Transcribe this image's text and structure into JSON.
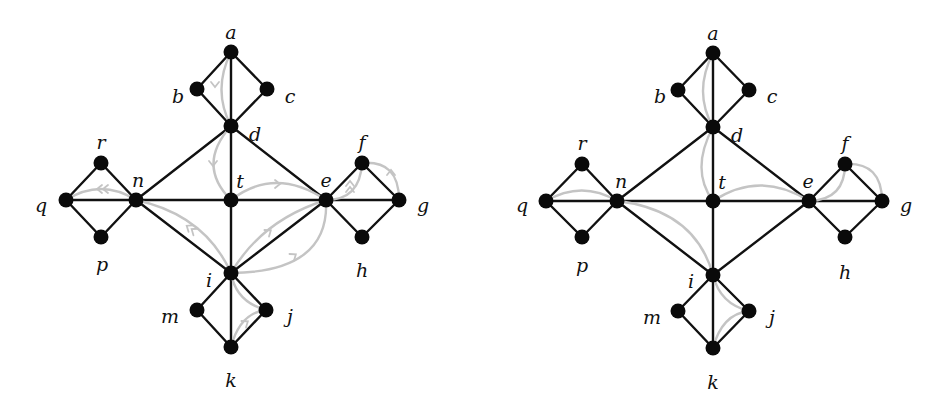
{
  "figure": {
    "panels": [
      {
        "id": "left",
        "offset_x": 0,
        "directed": true,
        "nodes": {
          "a": [
            231,
            52
          ],
          "b": [
            197,
            89
          ],
          "c": [
            267,
            89
          ],
          "d": [
            231,
            126
          ],
          "r": [
            101,
            163
          ],
          "n": [
            136,
            200
          ],
          "q": [
            66,
            200
          ],
          "p": [
            101,
            237
          ],
          "t": [
            231,
            200
          ],
          "e": [
            326,
            200
          ],
          "f": [
            362,
            163
          ],
          "g": [
            399,
            200
          ],
          "h": [
            362,
            237
          ],
          "i": [
            231,
            273
          ],
          "m": [
            197,
            310
          ],
          "j": [
            266,
            310
          ],
          "k": [
            231,
            347
          ]
        },
        "labels": {
          "a": [
            231,
            34
          ],
          "b": [
            178,
            98
          ],
          "c": [
            290,
            98
          ],
          "d": [
            255,
            136
          ],
          "r": [
            101,
            144
          ],
          "n": [
            138,
            182
          ],
          "q": [
            41,
            207
          ],
          "p": [
            102,
            266
          ],
          "t": [
            240,
            183
          ],
          "e": [
            326,
            182
          ],
          "f": [
            362,
            144
          ],
          "g": [
            423,
            207
          ],
          "h": [
            362,
            272
          ],
          "i": [
            209,
            282
          ],
          "m": [
            170,
            318
          ],
          "j": [
            290,
            318
          ],
          "k": [
            231,
            382
          ]
        },
        "edges": [
          [
            "a",
            "b"
          ],
          [
            "a",
            "c"
          ],
          [
            "b",
            "d"
          ],
          [
            "c",
            "d"
          ],
          [
            "a",
            "d"
          ],
          [
            "d",
            "t"
          ],
          [
            "d",
            "n"
          ],
          [
            "d",
            "e"
          ],
          [
            "n",
            "t"
          ],
          [
            "t",
            "e"
          ],
          [
            "n",
            "i"
          ],
          [
            "e",
            "i"
          ],
          [
            "t",
            "i"
          ],
          [
            "q",
            "r"
          ],
          [
            "q",
            "p"
          ],
          [
            "r",
            "n"
          ],
          [
            "p",
            "n"
          ],
          [
            "q",
            "n"
          ],
          [
            "e",
            "f"
          ],
          [
            "e",
            "h"
          ],
          [
            "f",
            "g"
          ],
          [
            "h",
            "g"
          ],
          [
            "e",
            "g"
          ],
          [
            "i",
            "m"
          ],
          [
            "i",
            "j"
          ],
          [
            "m",
            "k"
          ],
          [
            "j",
            "k"
          ],
          [
            "i",
            "k"
          ]
        ],
        "curves": [
          {
            "d": "M231,52 Q212,90 231,126",
            "arrow": [
              215,
              86
            ],
            "dir": "down"
          },
          {
            "d": "M231,126 Q196,165 231,200",
            "arrow": [
              213,
              165
            ],
            "dir": "down"
          },
          {
            "d": "M66,200 Q101,178 136,200",
            "arrow": [
              101,
              189
            ],
            "dir": "left",
            "double": true
          },
          {
            "d": "M136,200 Q205,215 231,273",
            "arrow": [
              190,
              228
            ],
            "dir": "up-left",
            "double": true
          },
          {
            "d": "M231,200 Q275,166 326,200",
            "arrow": [
              279,
              184
            ],
            "dir": "right"
          },
          {
            "d": "M326,200 Q262,220 231,273",
            "arrow": [
              270,
              231
            ],
            "dir": "up-right"
          },
          {
            "d": "M326,200 Q330,272 231,273",
            "arrow": [
              295,
              255
            ],
            "dir": "up-right"
          },
          {
            "d": "M326,200 Q360,200 362,163",
            "arrow": [
              350,
              185
            ],
            "dir": "up",
            "double": true
          },
          {
            "d": "M362,163 Q399,160 399,200",
            "arrow": [
              391,
              171
            ],
            "dir": "up"
          },
          {
            "d": "M231,273 Q236,302 266,310",
            "arrow": [
              245,
              296
            ],
            "dir": "none"
          },
          {
            "d": "M266,310 Q240,313 231,347",
            "arrow": [
              247,
              322
            ],
            "dir": "up-right"
          }
        ]
      },
      {
        "id": "right",
        "offset_x": 0,
        "directed": false,
        "nodes": {
          "a": [
            713,
            53
          ],
          "b": [
            678,
            90
          ],
          "c": [
            749,
            90
          ],
          "d": [
            713,
            127
          ],
          "r": [
            582,
            164
          ],
          "n": [
            617,
            201
          ],
          "q": [
            546,
            201
          ],
          "p": [
            582,
            237
          ],
          "t": [
            713,
            201
          ],
          "e": [
            809,
            201
          ],
          "f": [
            845,
            164
          ],
          "g": [
            882,
            201
          ],
          "h": [
            845,
            237
          ],
          "i": [
            713,
            275
          ],
          "m": [
            678,
            311
          ],
          "j": [
            749,
            311
          ],
          "k": [
            713,
            348
          ]
        },
        "labels": {
          "a": [
            713,
            35
          ],
          "b": [
            660,
            98
          ],
          "c": [
            772,
            98
          ],
          "d": [
            737,
            137
          ],
          "r": [
            582,
            145
          ],
          "n": [
            621,
            183
          ],
          "q": [
            522,
            207
          ],
          "p": [
            582,
            267
          ],
          "t": [
            722,
            184
          ],
          "e": [
            808,
            183
          ],
          "f": [
            845,
            145
          ],
          "g": [
            906,
            207
          ],
          "h": [
            845,
            274
          ],
          "i": [
            691,
            283
          ],
          "m": [
            652,
            319
          ],
          "j": [
            772,
            319
          ],
          "k": [
            713,
            384
          ]
        },
        "edges": [
          [
            "a",
            "b"
          ],
          [
            "a",
            "c"
          ],
          [
            "b",
            "d"
          ],
          [
            "c",
            "d"
          ],
          [
            "a",
            "d"
          ],
          [
            "d",
            "t"
          ],
          [
            "d",
            "n"
          ],
          [
            "d",
            "e"
          ],
          [
            "n",
            "t"
          ],
          [
            "t",
            "e"
          ],
          [
            "n",
            "i"
          ],
          [
            "e",
            "i"
          ],
          [
            "t",
            "i"
          ],
          [
            "q",
            "r"
          ],
          [
            "q",
            "p"
          ],
          [
            "r",
            "n"
          ],
          [
            "p",
            "n"
          ],
          [
            "q",
            "n"
          ],
          [
            "e",
            "f"
          ],
          [
            "e",
            "h"
          ],
          [
            "f",
            "g"
          ],
          [
            "h",
            "g"
          ],
          [
            "e",
            "g"
          ],
          [
            "i",
            "m"
          ],
          [
            "i",
            "j"
          ],
          [
            "m",
            "k"
          ],
          [
            "j",
            "k"
          ],
          [
            "i",
            "k"
          ]
        ],
        "curves": [
          {
            "d": "M713,53 Q693,92 713,127"
          },
          {
            "d": "M713,127 Q690,170 713,201"
          },
          {
            "d": "M546,201 Q582,180 617,201"
          },
          {
            "d": "M617,201 Q695,210 713,275"
          },
          {
            "d": "M713,201 Q760,170 809,201"
          },
          {
            "d": "M809,201 Q845,200 845,164"
          },
          {
            "d": "M845,164 Q882,162 882,201"
          },
          {
            "d": "M713,275 Q720,304 749,311"
          },
          {
            "d": "M749,311 Q722,314 713,348"
          }
        ]
      }
    ]
  }
}
